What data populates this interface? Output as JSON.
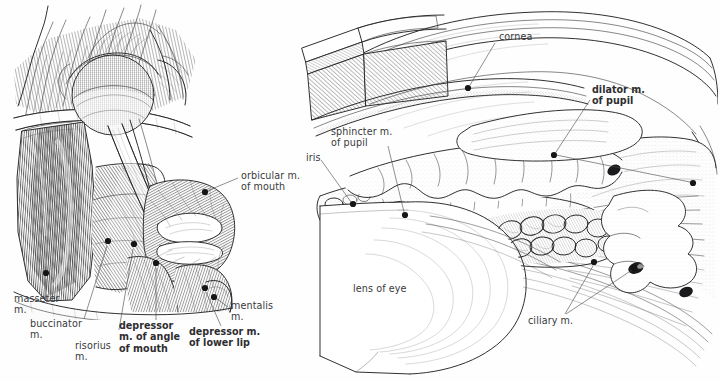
{
  "plate": {
    "background_color": "#fefefe",
    "ink_color": "#3c3c3e",
    "label_color": "#39393b",
    "figure_count": 2
  },
  "figures": [
    {
      "id": "facial-muscles",
      "name": "facial muscles lateral dissection",
      "position": "left",
      "labels": [
        {
          "id": "masseter",
          "text": "masseter\nm.",
          "bold": false,
          "x": 14,
          "y": 297,
          "align": "left",
          "leader": {
            "from": [
              45,
              300
            ],
            "to": [
              46,
              279
            ]
          },
          "dot": [
            46,
            272
          ]
        },
        {
          "id": "buccinator",
          "text": "buccinator\nm.",
          "bold": false,
          "x": 30,
          "y": 322,
          "align": "left",
          "leader": {
            "from": [
              84,
              321
            ],
            "to": [
              107,
              245
            ]
          },
          "dot": [
            108,
            240
          ]
        },
        {
          "id": "risorius",
          "text": "risorius\nm.",
          "bold": false,
          "x": 75,
          "y": 345,
          "align": "left",
          "leader": {
            "from": [
              117,
              343
            ],
            "to": [
              133,
              248
            ]
          },
          "dot": [
            134,
            243
          ]
        },
        {
          "id": "depressor-angle-mouth",
          "text": "depressor\nm. of angle\nof mouth",
          "bold": true,
          "x": 119,
          "y": 325,
          "align": "left",
          "leader": {
            "from": [
              156,
              322
            ],
            "to": [
              156,
              267
            ]
          },
          "dot": [
            156,
            262
          ]
        },
        {
          "id": "depressor-lower-lip",
          "text": "depressor m.\nof lower lip",
          "bold": true,
          "x": 189,
          "y": 331,
          "align": "left",
          "leader": {
            "from": [
              221,
              328
            ],
            "to": [
              205,
              292
            ]
          },
          "dot": [
            204,
            288
          ]
        },
        {
          "id": "mentalis",
          "text": "mentalis\nm.",
          "bold": false,
          "x": 231,
          "y": 303,
          "align": "left",
          "leader": {
            "from": [
              228,
              309
            ],
            "to": [
              215,
              298
            ]
          },
          "dot": [
            213,
            297
          ]
        },
        {
          "id": "orbicular-mouth",
          "text": "orbicular m.\nof mouth",
          "bold": false,
          "x": 240,
          "y": 172,
          "align": "left",
          "leader": {
            "from": [
              238,
              179
            ],
            "to": [
              206,
              192
            ]
          },
          "dot": [
            204,
            193
          ]
        }
      ]
    },
    {
      "id": "eye-iris-ciliary",
      "name": "eye anterior segment sagittal section",
      "position": "right",
      "labels": [
        {
          "id": "cornea",
          "text": "cornea",
          "bold": false,
          "x": 498,
          "y": 35,
          "align": "left",
          "leader": {
            "from": [
              495,
              43
            ],
            "to": [
              470,
              85
            ]
          },
          "dot": [
            468,
            88
          ]
        },
        {
          "id": "dilator-pupil",
          "text": "dilator m.\nof pupil",
          "bold": true,
          "x": 592,
          "y": 88,
          "align": "left",
          "leader": {
            "from": [
              590,
              100
            ],
            "to": [
              556,
              152
            ]
          },
          "dot": [
            554,
            155
          ]
        },
        {
          "id": "dilator-pupil-far",
          "text": "",
          "bold": false,
          "x": 0,
          "y": 0,
          "align": "left",
          "leader": {
            "from": [
              556,
              155
            ],
            "to": [
              692,
              183
            ]
          },
          "dot": [
            694,
            183
          ]
        },
        {
          "id": "sphincter-pupil",
          "text": "sphincter m.\nof pupil",
          "bold": false,
          "x": 330,
          "y": 128,
          "align": "left",
          "leader": {
            "from": [
              388,
              146
            ],
            "to": [
              404,
              213
            ]
          },
          "dot": [
            405,
            216
          ]
        },
        {
          "id": "iris",
          "text": "iris",
          "bold": false,
          "x": 305,
          "y": 155,
          "align": "left",
          "leader": {
            "from": [
              321,
              160
            ],
            "to": [
              351,
              203
            ]
          },
          "dot": [
            353,
            205
          ]
        },
        {
          "id": "lens-of-eye",
          "text": "lens of eye",
          "bold": false,
          "x": 353,
          "y": 286,
          "align": "left",
          "leader": null,
          "dot": null
        },
        {
          "id": "ciliary-m",
          "text": "ciliary m.",
          "bold": false,
          "x": 528,
          "y": 318,
          "align": "left",
          "leader": {
            "from": [
              565,
              316
            ],
            "to": [
              593,
              267
            ]
          },
          "dot": [
            594,
            263
          ]
        },
        {
          "id": "ciliary-m-2",
          "text": "",
          "bold": false,
          "x": 0,
          "y": 0,
          "align": "left",
          "leader": {
            "from": [
              566,
              316
            ],
            "to": [
              632,
              271
            ]
          },
          "dot": [
            634,
            269
          ]
        }
      ]
    }
  ]
}
